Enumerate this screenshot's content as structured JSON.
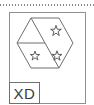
{
  "drawing": {
    "title": "XD",
    "frame": {
      "stroke": "#909090",
      "fill": "#ffffff"
    },
    "top_rule": {
      "style": "dotted",
      "color": "#8a8a8a"
    },
    "hexagon": {
      "shape": "hexagon",
      "orientation": "flat-top",
      "stroke": "#6e6e6e",
      "fill": "none",
      "partitions": [
        {
          "id": "partition-upper-right",
          "description": "upper-right region",
          "marker": "star"
        },
        {
          "id": "partition-lower-left",
          "description": "lower-left region",
          "marker": "star"
        },
        {
          "id": "partition-lower-right",
          "description": "lower-right region",
          "marker": "star"
        }
      ],
      "divider_lines": [
        "center-to-top-left-vertex",
        "center-to-left-vertex",
        "center-to-bottom-vertex"
      ]
    },
    "stars": {
      "count": 3,
      "points": 5,
      "stroke": "#5a5a5a",
      "fill": "none"
    },
    "label_box": {
      "text": "XD",
      "stroke": "#707070",
      "text_color": "#3a3a3a"
    }
  }
}
